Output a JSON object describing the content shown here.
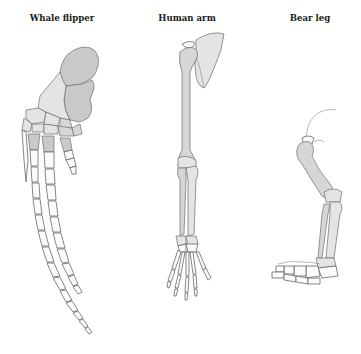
{
  "diagram": {
    "panels": [
      {
        "id": "whale",
        "label": "Whale flipper",
        "icon": "whale-flipper-skeleton"
      },
      {
        "id": "human",
        "label": "Human arm",
        "icon": "human-arm-skeleton"
      },
      {
        "id": "bear",
        "label": "Bear leg",
        "icon": "bear-leg-skeleton"
      }
    ],
    "colors": {
      "background": "#ffffff",
      "bone_dark": "#c9c9c9",
      "bone_mid": "#d6d6d6",
      "bone_light": "#e4e4e4",
      "bone_white": "#fbfbfb",
      "outline": "#6d6d6d",
      "label": "#1a1a1a"
    }
  }
}
